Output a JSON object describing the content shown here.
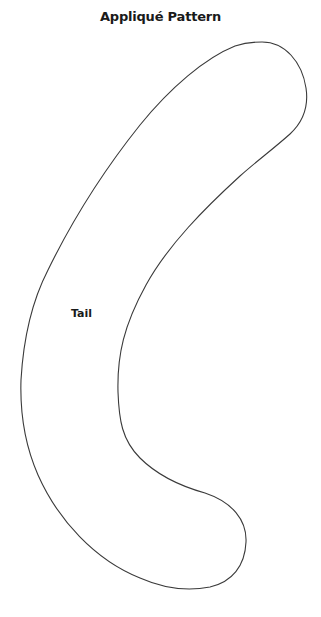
{
  "title": "Appliqué Pattern",
  "pattern": {
    "piece_label": "Tail",
    "stroke_color": "#3a3a3a",
    "fill_color": "#ffffff"
  }
}
